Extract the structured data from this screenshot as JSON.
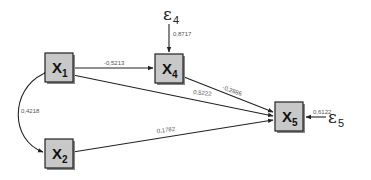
{
  "diagram": {
    "type": "path-diagram",
    "nodes": {
      "x1": {
        "label": "X",
        "sub": "1"
      },
      "x2": {
        "label": "X",
        "sub": "2"
      },
      "x4": {
        "label": "X",
        "sub": "4"
      },
      "x5": {
        "label": "X",
        "sub": "5"
      }
    },
    "errors": {
      "e4": {
        "label": "ε",
        "sub": "4"
      },
      "e5": {
        "label": "ε",
        "sub": "5"
      }
    },
    "edges": [
      {
        "from": "x1",
        "to": "x4",
        "coef": "-0,5213"
      },
      {
        "from": "x4",
        "to": "x5",
        "coef": "-0,2886"
      },
      {
        "from": "x1",
        "to": "x5",
        "coef": "0,5222"
      },
      {
        "from": "x2",
        "to": "x5",
        "coef": "0,1782"
      },
      {
        "from": "x1",
        "to": "x2",
        "coef": "0,4218",
        "kind": "covariance"
      },
      {
        "from": "e4",
        "to": "x4",
        "coef": "0,8717"
      },
      {
        "from": "e5",
        "to": "x5",
        "coef": "0,6122"
      }
    ]
  }
}
